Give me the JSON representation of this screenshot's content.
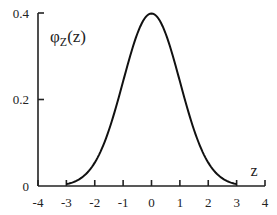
{
  "chart_data": {
    "type": "line",
    "title": "",
    "xlabel": "z",
    "ylabel": "φZ(z)",
    "ylabel_main": "φ",
    "ylabel_sub": "Z",
    "ylabel_arg": "(z)",
    "xlim": [
      -4,
      4
    ],
    "ylim": [
      0,
      0.4
    ],
    "xticks": [
      "-4",
      "-3",
      "-2",
      "-1",
      "0",
      "1",
      "2",
      "3",
      "4"
    ],
    "yticks": [
      "0",
      "0.2",
      "0.4"
    ],
    "grid": false,
    "legend": "none",
    "series": [
      {
        "name": "standard normal pdf (truncated at ±3)",
        "x": [
          -3,
          -2.5,
          -2,
          -1.5,
          -1,
          -0.5,
          0,
          0.5,
          1,
          1.5,
          2,
          2.5,
          3
        ],
        "y": [
          0.0044,
          0.0175,
          0.054,
          0.1295,
          0.242,
          0.3521,
          0.3989,
          0.3521,
          0.242,
          0.1295,
          0.054,
          0.0175,
          0.0044
        ]
      }
    ]
  }
}
